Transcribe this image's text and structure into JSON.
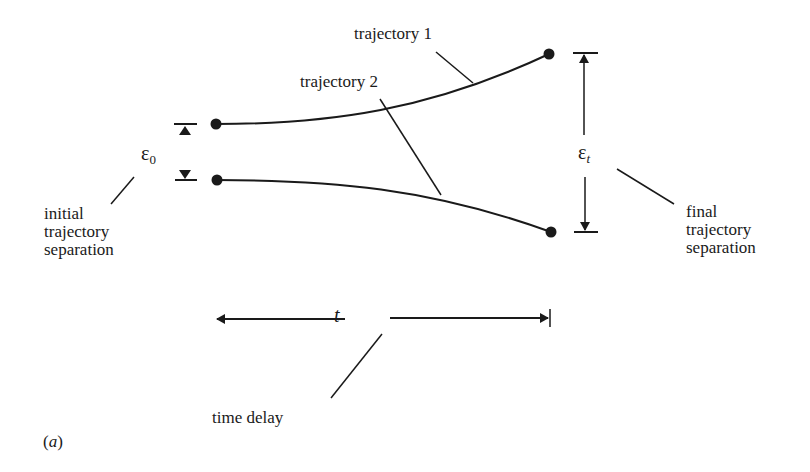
{
  "diagram": {
    "panel_label": "(a)",
    "trajectories": [
      {
        "name": "trajectory 1",
        "label": "trajectory 1"
      },
      {
        "name": "trajectory 2",
        "label": "trajectory 2"
      }
    ],
    "initial_separation": {
      "symbol": "ε",
      "subscript": "0",
      "caption_lines": [
        "initial",
        "trajectory",
        "separation"
      ]
    },
    "final_separation": {
      "symbol": "ε",
      "subscript": "t",
      "caption_lines": [
        "final",
        "trajectory",
        "separation"
      ]
    },
    "time_delay": {
      "symbol": "t",
      "caption": "time delay"
    },
    "colors": {
      "ink": "#1a1a1a",
      "background": "#ffffff"
    }
  }
}
